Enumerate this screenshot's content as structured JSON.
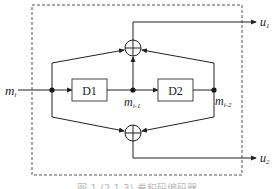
{
  "diagram": {
    "type": "convolutional-encoder",
    "input": {
      "label": "m",
      "subscript": "i"
    },
    "delays": [
      {
        "label": "D1"
      },
      {
        "label": "D2"
      }
    ],
    "taps": [
      {
        "label": "m",
        "subscript": "i-1"
      },
      {
        "label": "m",
        "subscript": "i-2"
      }
    ],
    "outputs": [
      {
        "label": "u",
        "subscript": "1"
      },
      {
        "label": "u",
        "subscript": "2"
      }
    ],
    "adders": [
      {
        "name": "top-adder",
        "symbol": "+"
      },
      {
        "name": "bottom-adder",
        "symbol": "+"
      }
    ],
    "caption": "图 1  (2,1,3) 卷积码编码器"
  },
  "colors": {
    "line": "#222222",
    "dashed_border": "#555555",
    "background": "#ffffff"
  }
}
